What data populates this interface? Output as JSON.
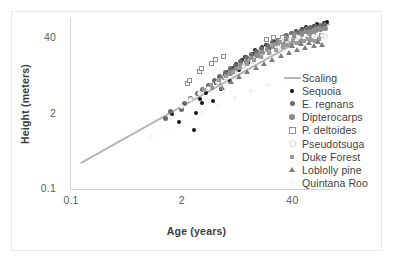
{
  "chart_data": {
    "type": "scatter",
    "title": "",
    "xlabel": "Age (years)",
    "ylabel": "Height (meters)",
    "xscale": "log",
    "yscale": "log",
    "xlim": [
      0.1,
      120
    ],
    "ylim": [
      0.1,
      90
    ],
    "xticks": [
      "0.1",
      "2",
      "40"
    ],
    "yticks": [
      "0.1",
      "2",
      "40"
    ],
    "grid": false,
    "legend_position": "right",
    "legend_entries": [
      {
        "label": "Scaling",
        "marker": "line",
        "color": "#b6b6b6"
      },
      {
        "label": "Sequoia",
        "marker": "filled-circle",
        "color": "#151515"
      },
      {
        "label": "E. regnans",
        "marker": "filled-circle",
        "color": "#6a6a6a"
      },
      {
        "label": "Dipterocarps",
        "marker": "filled-circle",
        "color": "#8b8b8b"
      },
      {
        "label": "P. deltoides",
        "marker": "open-square",
        "color": "#8e8e8e"
      },
      {
        "label": "Pseudotsuga",
        "marker": "open-circle",
        "color": "#d2d2d2"
      },
      {
        "label": "Duke Forest",
        "marker": "filled-square",
        "color": "#9a9a9a"
      },
      {
        "label": "Loblolly pine",
        "marker": "filled-triangle",
        "color": "#7d7d7d"
      },
      {
        "label": "Quintana Roo",
        "marker": "faint-circle",
        "color": "#fbfbfb"
      }
    ],
    "trendline": {
      "name": "Scaling",
      "color": "#b6b6b6",
      "x_start": 0.13,
      "y_start": 0.28,
      "x_end": 110,
      "y_end": 72
    },
    "series": [
      {
        "name": "Sequoia",
        "marker": "filled-circle",
        "color": "#151515",
        "points": [
          [
            1.6,
            1.9
          ],
          [
            1.9,
            1.4
          ],
          [
            2.9,
            1.0
          ],
          [
            3.0,
            2.0
          ],
          [
            3.4,
            3.4
          ],
          [
            3.6,
            3.0
          ],
          [
            4.0,
            4.4
          ],
          [
            4.4,
            5.4
          ],
          [
            4.8,
            3.2
          ],
          [
            5.2,
            6.6
          ],
          [
            5.6,
            7.6
          ],
          [
            6.0,
            5.2
          ],
          [
            6.6,
            8.8
          ],
          [
            7.0,
            10.2
          ],
          [
            7.6,
            7.0
          ],
          [
            8.2,
            12.0
          ],
          [
            9.0,
            14.0
          ],
          [
            9.6,
            11.0
          ],
          [
            10.5,
            16.0
          ],
          [
            11.5,
            18.0
          ],
          [
            12.5,
            14.5
          ],
          [
            14.0,
            21.0
          ],
          [
            15.0,
            24.0
          ],
          [
            16.5,
            19.0
          ],
          [
            18.0,
            27.0
          ],
          [
            20.0,
            30.0
          ],
          [
            22.0,
            25.0
          ],
          [
            24.0,
            33.0
          ],
          [
            26.0,
            36.0
          ],
          [
            28.0,
            31.0
          ],
          [
            31.0,
            39.0
          ],
          [
            34.0,
            43.0
          ],
          [
            37.0,
            38.0
          ],
          [
            41.0,
            47.0
          ],
          [
            45.0,
            52.0
          ],
          [
            49.0,
            45.0
          ],
          [
            54.0,
            56.0
          ],
          [
            60.0,
            61.0
          ],
          [
            66.0,
            54.0
          ],
          [
            73.0,
            64.0
          ],
          [
            80.0,
            68.0
          ],
          [
            88.0,
            60.0
          ],
          [
            96.0,
            70.0
          ],
          [
            105.0,
            74.0
          ]
        ]
      },
      {
        "name": "E. regnans",
        "marker": "filled-circle",
        "color": "#6a6a6a",
        "points": [
          [
            1.3,
            1.6
          ],
          [
            1.5,
            2.1
          ],
          [
            2.0,
            2.3
          ],
          [
            2.2,
            2.9
          ],
          [
            2.6,
            3.6
          ],
          [
            3.1,
            4.3
          ],
          [
            3.6,
            5.2
          ],
          [
            4.2,
            6.1
          ],
          [
            4.9,
            7.3
          ],
          [
            5.7,
            8.6
          ],
          [
            6.6,
            10.0
          ],
          [
            7.6,
            11.8
          ],
          [
            8.8,
            13.6
          ],
          [
            10.0,
            15.8
          ],
          [
            11.6,
            18.0
          ],
          [
            13.4,
            20.6
          ],
          [
            15.4,
            23.4
          ],
          [
            17.8,
            26.4
          ],
          [
            20.4,
            29.6
          ],
          [
            23.4,
            33.0
          ],
          [
            26.8,
            36.4
          ],
          [
            30.6,
            40.0
          ],
          [
            35.0,
            43.6
          ],
          [
            40.0,
            47.2
          ],
          [
            45.6,
            50.6
          ],
          [
            52.0,
            54.0
          ],
          [
            59.0,
            57.2
          ],
          [
            67.0,
            60.0
          ],
          [
            76.0,
            62.6
          ],
          [
            86.0,
            65.0
          ],
          [
            97.0,
            67.0
          ]
        ]
      },
      {
        "name": "Dipterocarps",
        "marker": "filled-circle",
        "color": "#8b8b8b",
        "points": [
          [
            4.5,
            5.6
          ],
          [
            5.4,
            6.9
          ],
          [
            6.3,
            8.3
          ],
          [
            7.4,
            9.8
          ],
          [
            8.6,
            11.5
          ],
          [
            10.0,
            13.4
          ],
          [
            11.6,
            15.4
          ],
          [
            13.4,
            17.6
          ],
          [
            15.4,
            20.0
          ],
          [
            17.8,
            22.6
          ],
          [
            20.4,
            25.4
          ],
          [
            23.4,
            28.4
          ],
          [
            26.8,
            31.4
          ],
          [
            30.6,
            34.6
          ],
          [
            35.0,
            37.8
          ],
          [
            40.0,
            41.0
          ],
          [
            45.6,
            44.2
          ],
          [
            52.0,
            47.2
          ],
          [
            59.0,
            50.0
          ],
          [
            67.0,
            52.6
          ],
          [
            76.0,
            55.0
          ],
          [
            86.0,
            57.0
          ],
          [
            97.0,
            58.8
          ],
          [
            28.0,
            36.0
          ],
          [
            33.0,
            40.0
          ],
          [
            38.0,
            33.0
          ],
          [
            43.0,
            45.0
          ],
          [
            49.0,
            38.0
          ],
          [
            56.0,
            50.0
          ],
          [
            63.0,
            43.0
          ]
        ]
      },
      {
        "name": "P. deltoides",
        "marker": "open-square",
        "color": "#8e8e8e",
        "points": [
          [
            2.4,
            6.4
          ],
          [
            2.5,
            7.4
          ],
          [
            3.3,
            10.4
          ],
          [
            3.5,
            12.0
          ],
          [
            4.6,
            14.6
          ],
          [
            5.0,
            16.6
          ],
          [
            6.2,
            19.0
          ],
          [
            20.0,
            38.0
          ],
          [
            24.0,
            40.0
          ],
          [
            31.0,
            41.0
          ],
          [
            38.0,
            42.0
          ],
          [
            46.0,
            43.0
          ],
          [
            58.0,
            43.5
          ],
          [
            72.0,
            44.0
          ],
          [
            90.0,
            44.5
          ]
        ]
      },
      {
        "name": "Pseudotsuga",
        "marker": "open-circle",
        "color": "#d2d2d2",
        "points": [
          [
            2.0,
            2.6
          ],
          [
            2.6,
            3.4
          ],
          [
            3.3,
            4.3
          ],
          [
            4.2,
            5.4
          ],
          [
            5.3,
            6.7
          ],
          [
            6.7,
            8.3
          ],
          [
            8.5,
            10.2
          ],
          [
            10.8,
            12.6
          ],
          [
            13.7,
            15.4
          ],
          [
            17.4,
            18.8
          ],
          [
            22.0,
            22.6
          ],
          [
            28.0,
            27.0
          ],
          [
            35.5,
            31.6
          ],
          [
            45.0,
            36.0
          ],
          [
            57.0,
            39.8
          ],
          [
            72.0,
            42.6
          ],
          [
            91.0,
            44.6
          ],
          [
            30.0,
            36.0
          ],
          [
            38.0,
            38.0
          ],
          [
            48.0,
            40.0
          ],
          [
            61.0,
            41.0
          ],
          [
            78.0,
            41.8
          ],
          [
            99.0,
            42.4
          ]
        ]
      },
      {
        "name": "Duke Forest",
        "marker": "filled-square",
        "color": "#9a9a9a",
        "points": [
          [
            3.8,
            5.0
          ],
          [
            4.6,
            6.0
          ],
          [
            5.6,
            7.2
          ],
          [
            6.8,
            8.6
          ],
          [
            8.2,
            10.2
          ],
          [
            10.0,
            12.0
          ],
          [
            12.1,
            14.0
          ],
          [
            14.7,
            16.2
          ],
          [
            17.8,
            18.6
          ],
          [
            21.6,
            21.2
          ],
          [
            26.2,
            24.0
          ],
          [
            31.8,
            26.8
          ],
          [
            38.6,
            29.6
          ],
          [
            46.8,
            32.2
          ],
          [
            56.8,
            34.6
          ],
          [
            68.9,
            36.6
          ],
          [
            83.6,
            38.2
          ],
          [
            24.0,
            30.0
          ],
          [
            29.0,
            33.0
          ],
          [
            35.0,
            30.0
          ],
          [
            42.0,
            35.0
          ],
          [
            51.0,
            33.0
          ],
          [
            62.0,
            37.0
          ],
          [
            75.0,
            35.0
          ]
        ]
      },
      {
        "name": "Loblolly pine",
        "marker": "filled-triangle",
        "color": "#7d7d7d",
        "points": [
          [
            6.0,
            5.6
          ],
          [
            7.5,
            7.0
          ],
          [
            9.4,
            8.6
          ],
          [
            11.8,
            10.4
          ],
          [
            14.8,
            12.4
          ],
          [
            18.5,
            14.6
          ],
          [
            23.2,
            17.0
          ],
          [
            29.0,
            19.6
          ],
          [
            36.3,
            22.2
          ],
          [
            45.4,
            24.8
          ],
          [
            56.8,
            27.2
          ],
          [
            71.0,
            29.4
          ],
          [
            88.8,
            31.2
          ],
          [
            40.0,
            30.0
          ],
          [
            50.0,
            32.0
          ],
          [
            63.0,
            33.5
          ],
          [
            79.0,
            34.5
          ]
        ]
      },
      {
        "name": "Quintana Roo",
        "marker": "faint-circle",
        "color": "#fbfbfb",
        "points": [
          [
            0.9,
            0.8
          ],
          [
            1.4,
            1.1
          ],
          [
            2.2,
            1.5
          ],
          [
            3.5,
            2.0
          ],
          [
            5.5,
            2.7
          ],
          [
            8.6,
            3.6
          ],
          [
            13.5,
            4.7
          ],
          [
            21.2,
            6.0
          ],
          [
            33.3,
            7.6
          ],
          [
            52.3,
            9.4
          ]
        ]
      }
    ]
  }
}
